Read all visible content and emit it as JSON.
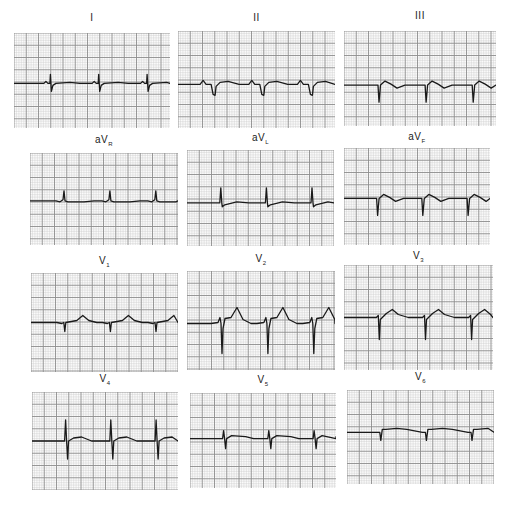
{
  "figure": {
    "colors": {
      "paper": "#fbfbfb",
      "minor_grid": "#c9c9c9",
      "major_grid": "#8c8c8c",
      "trace": "#1a1a1a",
      "label": "#222222"
    }
  },
  "leads": [
    {
      "id": "I",
      "label_main": "I",
      "label_sub": "",
      "beats": 3,
      "waveform": "small-neg-after-r",
      "rhythm": "regular"
    },
    {
      "id": "II",
      "label_main": "II",
      "label_sub": "",
      "beats": 3,
      "waveform": "q-dominant-negative",
      "rhythm": "regular"
    },
    {
      "id": "III",
      "label_main": "III",
      "label_sub": "",
      "beats": 3,
      "waveform": "deep-q-negative",
      "rhythm": "regular"
    },
    {
      "id": "aVR",
      "label_main": "aV",
      "label_sub": "R",
      "beats": 3,
      "waveform": "small-positive-r",
      "rhythm": "regular"
    },
    {
      "id": "aVL",
      "label_main": "aV",
      "label_sub": "L",
      "beats": 3,
      "waveform": "tall-positive-r",
      "rhythm": "regular"
    },
    {
      "id": "aVF",
      "label_main": "aV",
      "label_sub": "F",
      "beats": 3,
      "waveform": "deep-q-negative",
      "rhythm": "regular"
    },
    {
      "id": "V1",
      "label_main": "V",
      "label_sub": "1",
      "beats": 3,
      "waveform": "small-negative",
      "rhythm": "regular"
    },
    {
      "id": "V2",
      "label_main": "V",
      "label_sub": "2",
      "beats": 3,
      "waveform": "deep-s-peaked-t",
      "rhythm": "regular"
    },
    {
      "id": "V3",
      "label_main": "V",
      "label_sub": "3",
      "beats": 3,
      "waveform": "deep-s-upright-t",
      "rhythm": "regular"
    },
    {
      "id": "V4",
      "label_main": "V",
      "label_sub": "4",
      "beats": 3,
      "waveform": "rs-biphasic",
      "rhythm": "regular"
    },
    {
      "id": "V5",
      "label_main": "V",
      "label_sub": "5",
      "beats": 3,
      "waveform": "small-rs",
      "rhythm": "regular"
    },
    {
      "id": "V6",
      "label_main": "V",
      "label_sub": "6",
      "beats": 3,
      "waveform": "small-q-negative",
      "rhythm": "regular"
    }
  ]
}
